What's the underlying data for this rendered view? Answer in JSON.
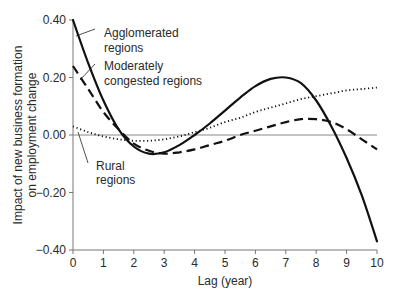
{
  "chart_data": {
    "type": "line",
    "title": "",
    "xlabel": "Lag (year)",
    "ylabel": "Impact of new business formation on employment change",
    "ylabel_lines": [
      "Impact of new business formation",
      "on employment change"
    ],
    "xlim": [
      0,
      10
    ],
    "ylim": [
      -0.4,
      0.4
    ],
    "xticks": [
      0,
      1,
      2,
      3,
      4,
      5,
      6,
      7,
      8,
      9,
      10
    ],
    "xtick_labels": [
      "0",
      "1",
      "2",
      "3",
      "4",
      "5",
      "6",
      "7",
      "8",
      "9",
      "10"
    ],
    "yticks": [
      0.4,
      0.2,
      0.0,
      -0.2,
      -0.4
    ],
    "ytick_labels": [
      "0.40",
      "0.20",
      "0.00",
      "−0.20",
      "−0.40"
    ],
    "grid": false,
    "reference_line": {
      "y": 0.0,
      "color": "#888888"
    },
    "legend_position": "inline-annotations",
    "series": [
      {
        "name": "Agglomerated regions",
        "style": "solid",
        "x": [
          0,
          0.5,
          1,
          1.5,
          2,
          2.5,
          3,
          3.5,
          4,
          4.5,
          5,
          5.5,
          6,
          6.5,
          7,
          7.5,
          8,
          8.5,
          9,
          9.5,
          10
        ],
        "values": [
          0.4,
          0.25,
          0.12,
          0.02,
          -0.04,
          -0.065,
          -0.06,
          -0.035,
          0.0,
          0.04,
          0.085,
          0.13,
          0.17,
          0.195,
          0.2,
          0.18,
          0.12,
          0.03,
          -0.08,
          -0.21,
          -0.37
        ]
      },
      {
        "name": "Moderately congested regions",
        "style": "dashed",
        "x": [
          0,
          0.5,
          1,
          1.5,
          2,
          2.5,
          3,
          3.5,
          4,
          4.5,
          5,
          5.5,
          6,
          6.5,
          7,
          7.5,
          8,
          8.5,
          9,
          9.5,
          10
        ],
        "values": [
          0.24,
          0.16,
          0.08,
          0.02,
          -0.03,
          -0.055,
          -0.065,
          -0.06,
          -0.05,
          -0.035,
          -0.02,
          0.0,
          0.015,
          0.03,
          0.045,
          0.055,
          0.055,
          0.045,
          0.02,
          -0.015,
          -0.05
        ]
      },
      {
        "name": "Rural regions",
        "style": "dotted",
        "x": [
          0,
          0.5,
          1,
          1.5,
          2,
          2.5,
          3,
          3.5,
          4,
          4.5,
          5,
          5.5,
          6,
          6.5,
          7,
          7.5,
          8,
          8.5,
          9,
          9.5,
          10
        ],
        "values": [
          0.03,
          0.01,
          -0.005,
          -0.015,
          -0.02,
          -0.02,
          -0.015,
          -0.005,
          0.01,
          0.025,
          0.045,
          0.06,
          0.08,
          0.095,
          0.11,
          0.125,
          0.135,
          0.145,
          0.155,
          0.16,
          0.165
        ]
      }
    ],
    "annotations": [
      {
        "text_lines": [
          "Agglomerated",
          "regions"
        ],
        "series": "Agglomerated regions"
      },
      {
        "text_lines": [
          "Moderately",
          "congested regions"
        ],
        "series": "Moderately congested regions"
      },
      {
        "text_lines": [
          "Rural",
          "regions"
        ],
        "series": "Rural regions"
      }
    ]
  }
}
